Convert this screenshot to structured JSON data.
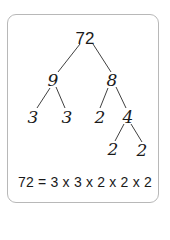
{
  "diagram": {
    "type": "factor-tree",
    "root": "72",
    "nodes": {
      "root": "72",
      "left": "9",
      "right": "8",
      "left_left": "3",
      "left_right": "3",
      "right_left": "2",
      "right_right": "4",
      "right_right_left": "2",
      "right_right_right": "2"
    },
    "equation": "72 = 3 x 3 x 2 x 2 x 2",
    "colors": {
      "ink": "#1a1a1a",
      "border": "#b8b8b8",
      "background": "#ffffff"
    }
  }
}
